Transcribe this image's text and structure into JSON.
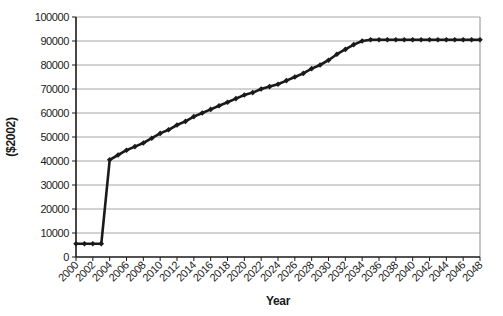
{
  "figure": {
    "background": "#ffffff",
    "plot_border_color": "#8c8c8c",
    "gridline_color": "#a6a6a6",
    "axis_color": "#1a1a1a"
  },
  "chart_data": {
    "type": "line",
    "title": "",
    "xlabel": "Year",
    "ylabel": "($2002)",
    "x": [
      2000,
      2001,
      2002,
      2003,
      2004,
      2005,
      2006,
      2007,
      2008,
      2009,
      2010,
      2011,
      2012,
      2013,
      2014,
      2015,
      2016,
      2017,
      2018,
      2019,
      2020,
      2021,
      2022,
      2023,
      2024,
      2025,
      2026,
      2027,
      2028,
      2029,
      2030,
      2031,
      2032,
      2033,
      2034,
      2035,
      2036,
      2037,
      2038,
      2039,
      2040,
      2041,
      2042,
      2043,
      2044,
      2045,
      2046,
      2047,
      2048
    ],
    "series": [
      {
        "name": "real-dollar-value",
        "color": "#1a1a1a",
        "marker": "diamond",
        "values": [
          5500,
          5500,
          5500,
          5500,
          40500,
          42500,
          44500,
          46000,
          47500,
          49500,
          51500,
          53000,
          55000,
          56500,
          58500,
          60000,
          61500,
          63000,
          64500,
          66000,
          67500,
          68500,
          70000,
          71000,
          72000,
          73500,
          75000,
          76500,
          78500,
          80000,
          82000,
          84500,
          86500,
          88500,
          90000,
          90500,
          90500,
          90500,
          90500,
          90500,
          90500,
          90500,
          90500,
          90500,
          90500,
          90500,
          90500,
          90500,
          90500
        ]
      }
    ],
    "xlim": [
      2000,
      2048
    ],
    "ylim": [
      0,
      100000
    ],
    "x_tick_step": 2,
    "y_tick_step": 10000,
    "y_tick_labels": [
      "0",
      "10000",
      "20000",
      "30000",
      "40000",
      "50000",
      "60000",
      "70000",
      "80000",
      "90000",
      "100000"
    ],
    "x_tick_labels": [
      "2000",
      "2002",
      "2004",
      "2006",
      "2008",
      "2010",
      "2012",
      "2014",
      "2016",
      "2018",
      "2020",
      "2022",
      "2024",
      "2026",
      "2028",
      "2030",
      "2032",
      "2034",
      "2036",
      "2038",
      "2040",
      "2042",
      "2044",
      "2046",
      "2048"
    ],
    "grid": "horizontal",
    "legend": "none",
    "x_tick_label_rotation": -45
  }
}
